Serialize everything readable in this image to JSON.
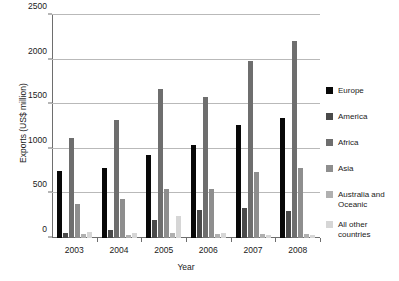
{
  "chart_data": {
    "type": "bar",
    "title": "",
    "xlabel": "Year",
    "ylabel": "Exports (US$ million)",
    "categories": [
      "2003",
      "2004",
      "2005",
      "2006",
      "2007",
      "2008"
    ],
    "ylim": [
      0,
      2500
    ],
    "yticks": [
      0,
      500,
      1000,
      1500,
      2000,
      2500
    ],
    "ytick_labels": [
      "0",
      "500",
      "1000",
      "1500",
      "2000",
      "2500"
    ],
    "grid": true,
    "legend_position": "right",
    "series": [
      {
        "name": "Europe",
        "color": "#080808",
        "values": [
          750,
          790,
          930,
          1040,
          1270,
          1340
        ]
      },
      {
        "name": "America",
        "color": "#4a4a4a",
        "values": [
          60,
          90,
          200,
          310,
          340,
          300
        ]
      },
      {
        "name": "Africa",
        "color": "#6e6e6e",
        "values": [
          1120,
          1320,
          1670,
          1580,
          1990,
          2210
        ]
      },
      {
        "name": "Asia",
        "color": "#8e8e8e",
        "values": [
          380,
          440,
          545,
          550,
          745,
          780
        ]
      },
      {
        "name": "Australia and Oceanic",
        "color": "#b0b0b0",
        "values": [
          40,
          35,
          55,
          45,
          50,
          45
        ]
      },
      {
        "name": "All other countries",
        "color": "#d6d6d6",
        "values": [
          70,
          60,
          245,
          60,
          30,
          30
        ]
      }
    ]
  },
  "legend": {
    "items": [
      {
        "label": "Europe",
        "color": "#080808"
      },
      {
        "label": "America",
        "color": "#4a4a4a"
      },
      {
        "label": "Africa",
        "color": "#6e6e6e"
      },
      {
        "label": "Asia",
        "color": "#8e8e8e"
      },
      {
        "label": "Australia and\nOceanic",
        "color": "#b0b0b0"
      },
      {
        "label": "All other\ncountries",
        "color": "#d6d6d6"
      }
    ]
  }
}
